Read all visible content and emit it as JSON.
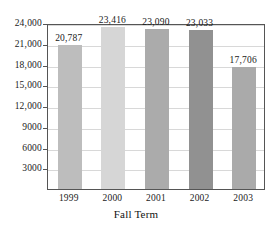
{
  "chart_data": {
    "type": "bar",
    "title": "",
    "subtitle": "",
    "xlabel": "Fall Term",
    "ylabel": "",
    "categories": [
      "1999",
      "2000",
      "2001",
      "2002",
      "2003"
    ],
    "values": [
      20787,
      23416,
      23090,
      23033,
      17706
    ],
    "value_labels": [
      "20,787",
      "23,416",
      "23,090",
      "23,033",
      "17,706"
    ],
    "bar_colors": [
      "#bdbdbd",
      "#d6d6d6",
      "#ababab",
      "#919191",
      "#aaaaaa"
    ],
    "ylim": [
      0,
      24000
    ],
    "ytick_values": [
      3000,
      6000,
      9000,
      12000,
      15000,
      18000,
      21000,
      24000
    ],
    "ytick_labels": [
      "3000",
      "6000",
      "9000",
      "12,000",
      "15,000",
      "18,000",
      "21,000",
      "24,000"
    ],
    "grid": true,
    "grid_color": "#d8d8d8",
    "legend": null,
    "legend_position": "none",
    "frame_color": "#555555"
  }
}
